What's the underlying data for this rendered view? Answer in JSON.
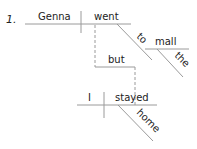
{
  "diagram": {
    "number": "1.",
    "main_clause": {
      "subject": "Genna",
      "verb": "went",
      "preposition": "to",
      "object": "mall",
      "article": "the"
    },
    "conjunction": "but",
    "second_clause": {
      "subject": "I",
      "verb": "stayed",
      "adverb": "home"
    },
    "colors": {
      "line": "#9a9a9a",
      "text": "#222222"
    }
  }
}
